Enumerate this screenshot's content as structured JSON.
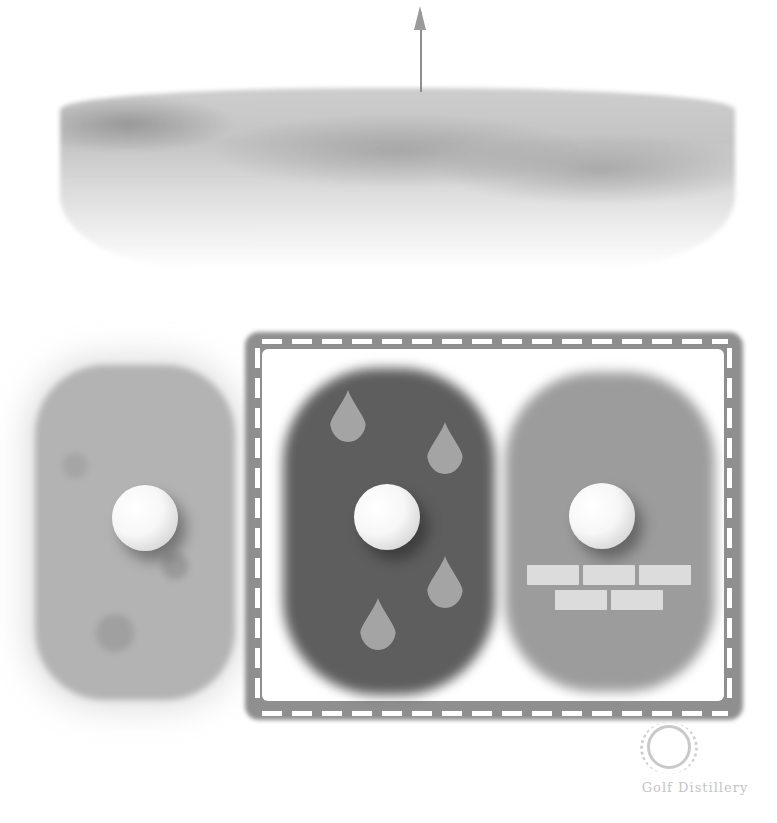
{
  "illustration": {
    "subject": "golf lies comparison",
    "scenes": {
      "top": {
        "name": "putting green hill with flag"
      },
      "left": {
        "name": "rough lie",
        "ball": "golf-ball"
      },
      "framed": [
        {
          "name": "wet turf lie",
          "ball": "golf-ball",
          "icons": [
            "water-drop",
            "water-drop",
            "water-drop",
            "water-drop"
          ]
        },
        {
          "name": "firm turf lie",
          "ball": "golf-ball",
          "icons": [
            "brick-wall"
          ]
        }
      ]
    },
    "colors": {
      "background": "#ffffff",
      "frame": "#8d8d8d",
      "wet_turf": "#5e5e5e",
      "firm_turf": "#9c9c9c",
      "rough": "#b3b3b3",
      "drop": "#a4a4a4",
      "brick": "#dcdcdc"
    }
  },
  "watermark": {
    "brand": "Golf Distillery",
    "icon": "laurel-wreath-icon"
  }
}
